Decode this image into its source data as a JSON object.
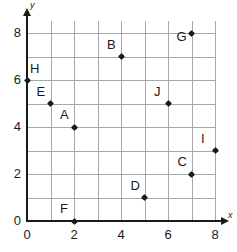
{
  "chart_data": {
    "type": "scatter",
    "title": "",
    "xlabel": "x",
    "ylabel": "y",
    "xlim": [
      0,
      8
    ],
    "ylim": [
      0,
      8
    ],
    "grid": true,
    "grid_step": 1,
    "legend": "none",
    "x_ticks": [
      "0",
      "2",
      "4",
      "6",
      "8"
    ],
    "x_tick_values": [
      0,
      2,
      4,
      6,
      8
    ],
    "y_ticks": [
      "0",
      "2",
      "4",
      "6",
      "8"
    ],
    "y_tick_values": [
      0,
      2,
      4,
      6,
      8
    ],
    "points": [
      {
        "label": "A",
        "x": 2,
        "y": 4,
        "label_pos": "above-left"
      },
      {
        "label": "B",
        "x": 4,
        "y": 7,
        "label_pos": "above-left"
      },
      {
        "label": "C",
        "x": 7,
        "y": 2,
        "label_pos": "above-left"
      },
      {
        "label": "D",
        "x": 5,
        "y": 1,
        "label_pos": "above-left"
      },
      {
        "label": "E",
        "x": 1,
        "y": 5,
        "label_pos": "above-left"
      },
      {
        "label": "F",
        "x": 2,
        "y": 0,
        "label_pos": "above-left"
      },
      {
        "label": "G",
        "x": 7,
        "y": 8,
        "label_pos": "left"
      },
      {
        "label": "H",
        "x": 0,
        "y": 6,
        "label_pos": "above-right"
      },
      {
        "label": "I",
        "x": 8,
        "y": 3,
        "label_pos": "above-left"
      },
      {
        "label": "J",
        "x": 6,
        "y": 5,
        "label_pos": "above-left"
      }
    ]
  },
  "colors": {
    "axis": "#1a1a1a",
    "grid": "#a8a8a8",
    "point": "#1a1a1a",
    "background": "#ffffff"
  }
}
